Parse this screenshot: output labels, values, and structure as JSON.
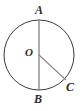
{
  "figure": {
    "background_color": "#ffffff",
    "width": 83,
    "height": 111,
    "circle": {
      "name": "circle",
      "center_x": 39,
      "center_y": 55,
      "radius": 35,
      "stroke_color": "#3a3a3a",
      "stroke_width": 1,
      "fill": "none"
    },
    "segments": [
      {
        "name": "diameter-AB",
        "from": "A",
        "to": "B",
        "x1": 39,
        "y1": 20,
        "x2": 39,
        "y2": 90,
        "stroke_color": "#8a8a8a",
        "stroke_width": 1.4
      },
      {
        "name": "radius-OC",
        "from": "O",
        "to": "C",
        "x1": 39,
        "y1": 55,
        "x2": 66,
        "y2": 80,
        "stroke_color": "#8a8a8a",
        "stroke_width": 1.1
      }
    ],
    "points": [
      {
        "id": "A",
        "label": "A",
        "x": 39,
        "y": 20,
        "position": "top"
      },
      {
        "id": "B",
        "label": "B",
        "x": 39,
        "y": 90,
        "position": "bottom"
      },
      {
        "id": "C",
        "label": "C",
        "x": 66,
        "y": 80,
        "position": "lower-right"
      },
      {
        "id": "O",
        "label": "O",
        "x": 39,
        "y": 55,
        "position": "center"
      }
    ],
    "labels": {
      "A": "A",
      "B": "B",
      "C": "C",
      "O": "O"
    }
  }
}
